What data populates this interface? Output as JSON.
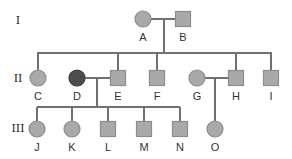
{
  "diagram": {
    "type": "pedigree",
    "colors": {
      "line": "#707070",
      "unaffected_fill": "#a9a9a9",
      "unaffected_stroke": "#8c8c8c",
      "affected_fill": "#4d4d4d",
      "affected_stroke": "#3c3c3c"
    },
    "generations": [
      {
        "label": "I",
        "y": 20
      },
      {
        "label": "II",
        "y": 78
      },
      {
        "label": "III",
        "y": 128
      }
    ],
    "individuals": [
      {
        "id": "A",
        "sex": "female",
        "affected": false,
        "generation": "I",
        "x": 143,
        "y": 19
      },
      {
        "id": "B",
        "sex": "male",
        "affected": false,
        "generation": "I",
        "x": 183,
        "y": 19
      },
      {
        "id": "C",
        "sex": "female",
        "affected": false,
        "generation": "II",
        "x": 38,
        "y": 78
      },
      {
        "id": "D",
        "sex": "female",
        "affected": true,
        "generation": "II",
        "x": 77,
        "y": 78
      },
      {
        "id": "E",
        "sex": "male",
        "affected": false,
        "generation": "II",
        "x": 118,
        "y": 78
      },
      {
        "id": "F",
        "sex": "male",
        "affected": false,
        "generation": "II",
        "x": 157,
        "y": 78
      },
      {
        "id": "G",
        "sex": "female",
        "affected": false,
        "generation": "II",
        "x": 197,
        "y": 78
      },
      {
        "id": "H",
        "sex": "male",
        "affected": false,
        "generation": "II",
        "x": 236,
        "y": 78
      },
      {
        "id": "I",
        "sex": "male",
        "affected": false,
        "generation": "II",
        "x": 271,
        "y": 78
      },
      {
        "id": "J",
        "sex": "female",
        "affected": false,
        "generation": "III",
        "x": 37,
        "y": 129
      },
      {
        "id": "K",
        "sex": "female",
        "affected": false,
        "generation": "III",
        "x": 72,
        "y": 129
      },
      {
        "id": "L",
        "sex": "male",
        "affected": false,
        "generation": "III",
        "x": 108,
        "y": 129
      },
      {
        "id": "M",
        "sex": "male",
        "affected": false,
        "generation": "III",
        "x": 144,
        "y": 129
      },
      {
        "id": "N",
        "sex": "male",
        "affected": false,
        "generation": "III",
        "x": 180,
        "y": 129
      },
      {
        "id": "O",
        "sex": "female",
        "affected": false,
        "generation": "III",
        "x": 215,
        "y": 129
      }
    ],
    "matings": [
      {
        "partners": [
          "A",
          "B"
        ],
        "children": [
          "C",
          "E",
          "F",
          "H",
          "I"
        ]
      },
      {
        "partners": [
          "D",
          "E"
        ],
        "children": [
          "J",
          "K",
          "L",
          "M",
          "N"
        ]
      },
      {
        "partners": [
          "G",
          "H"
        ],
        "children": [
          "O"
        ]
      }
    ]
  }
}
